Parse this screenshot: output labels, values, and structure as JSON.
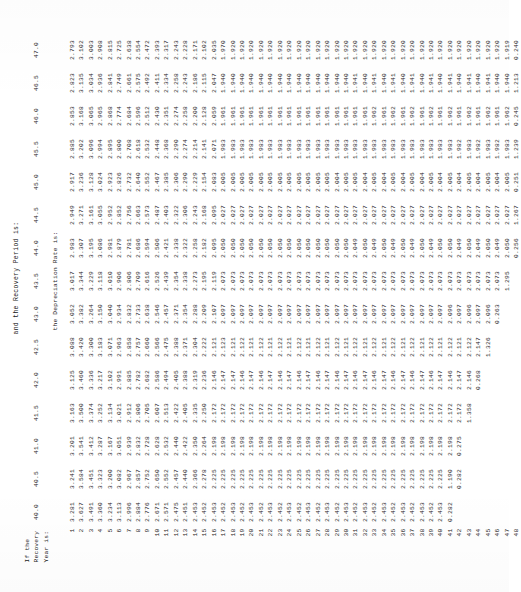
{
  "document": {
    "heading_line_1": "and the Recovery Period is:",
    "heading_line_2": "the Depreciation Rate is:",
    "stub_header": [
      "If the",
      "Recovery",
      "Year is:"
    ]
  },
  "chart_data": {
    "type": "table",
    "title": "and the Recovery Period is:",
    "subtitle": "the Depreciation Rate is:",
    "xlabel": "Recovery Period (years)",
    "ylabel": "Recovery Year",
    "categories": [
      "40.0",
      "40.5",
      "41.0",
      "41.5",
      "42.0",
      "42.5",
      "43.0",
      "43.5",
      "44.0",
      "44.5",
      "45.0",
      "45.5",
      "46.0",
      "46.5",
      "47.0"
    ],
    "row_labels": [
      "1",
      "2",
      "3",
      "4",
      "5",
      "6",
      "7",
      "8",
      "9",
      "10",
      "11",
      "12",
      "13",
      "14",
      "15",
      "16",
      "17",
      "18",
      "19",
      "20",
      "21",
      "22",
      "23",
      "24",
      "25",
      "26",
      "27",
      "28",
      "29",
      "30",
      "31",
      "32",
      "33",
      "34",
      "35",
      "36",
      "37",
      "38",
      "39",
      "40",
      "41",
      "42",
      "43",
      "44",
      "45",
      "46",
      "47",
      "48"
    ],
    "rows": [
      [
        "3.281",
        "3.241",
        "3.201",
        "3.163",
        "3.125",
        "3.088",
        "3.052",
        "3.017",
        "2.983",
        "2.949",
        "2.917",
        "2.885",
        "2.853",
        "2.823",
        "2.793"
      ],
      [
        "3.627",
        "3.584",
        "3.541",
        "3.500",
        "3.460",
        "3.420",
        "3.382",
        "3.344",
        "3.307",
        "3.271",
        "3.236",
        "3.202",
        "3.168",
        "3.135",
        "3.102"
      ],
      [
        "3.491",
        "3.451",
        "3.412",
        "3.374",
        "3.336",
        "3.300",
        "3.264",
        "3.229",
        "3.195",
        "3.161",
        "3.128",
        "3.096",
        "3.065",
        "3.034",
        "3.003"
      ],
      [
        "3.360",
        "3.323",
        "3.287",
        "3.252",
        "3.217",
        "3.183",
        "3.150",
        "3.118",
        "3.086",
        "3.055",
        "3.024",
        "2.994",
        "2.965",
        "2.936",
        "2.908"
      ],
      [
        "3.234",
        "3.200",
        "3.167",
        "3.134",
        "3.102",
        "3.071",
        "3.040",
        "3.010",
        "2.981",
        "2.952",
        "2.923",
        "2.895",
        "2.868",
        "2.841",
        "2.815"
      ],
      [
        "3.113",
        "3.082",
        "3.051",
        "3.021",
        "2.991",
        "2.963",
        "2.934",
        "2.906",
        "2.879",
        "2.852",
        "2.826",
        "2.800",
        "2.774",
        "2.749",
        "2.725"
      ],
      [
        "2.996",
        "2.967",
        "2.939",
        "2.912",
        "2.885",
        "2.858",
        "2.832",
        "2.806",
        "2.781",
        "2.756",
        "2.732",
        "2.708",
        "2.684",
        "2.661",
        "2.638"
      ],
      [
        "2.884",
        "2.857",
        "2.832",
        "2.806",
        "2.782",
        "2.757",
        "2.733",
        "2.709",
        "2.686",
        "2.663",
        "2.640",
        "2.618",
        "2.596",
        "2.575",
        "2.554"
      ],
      [
        "2.776",
        "2.752",
        "2.728",
        "2.705",
        "2.682",
        "2.660",
        "2.638",
        "2.616",
        "2.594",
        "2.573",
        "2.552",
        "2.532",
        "2.512",
        "2.492",
        "2.472"
      ],
      [
        "2.671",
        "2.650",
        "2.628",
        "2.607",
        "2.586",
        "2.566",
        "2.546",
        "2.526",
        "2.506",
        "2.487",
        "2.467",
        "2.448",
        "2.430",
        "2.411",
        "2.393"
      ],
      [
        "2.571",
        "2.552",
        "2.532",
        "2.513",
        "2.494",
        "2.475",
        "2.457",
        "2.439",
        "2.421",
        "2.403",
        "2.385",
        "2.368",
        "2.351",
        "2.334",
        "2.317"
      ],
      [
        "2.475",
        "2.457",
        "2.440",
        "2.422",
        "2.405",
        "2.388",
        "2.371",
        "2.354",
        "2.338",
        "2.322",
        "2.306",
        "2.290",
        "2.274",
        "2.258",
        "2.243"
      ],
      [
        "2.451",
        "2.440",
        "2.422",
        "2.405",
        "2.388",
        "2.371",
        "2.354",
        "2.338",
        "2.322",
        "2.306",
        "2.290",
        "2.274",
        "2.258",
        "2.243",
        "2.228"
      ],
      [
        "2.453",
        "2.366",
        "2.350",
        "2.335",
        "2.319",
        "2.304",
        "2.288",
        "2.273",
        "2.258",
        "2.243",
        "2.229",
        "2.214",
        "2.200",
        "2.186",
        "2.171"
      ],
      [
        "2.452",
        "2.278",
        "2.264",
        "2.250",
        "2.236",
        "2.222",
        "2.209",
        "2.195",
        "2.182",
        "2.168",
        "2.154",
        "2.141",
        "2.128",
        "2.115",
        "2.102"
      ],
      [
        "2.453",
        "2.225",
        "2.198",
        "2.172",
        "2.146",
        "2.121",
        "2.107",
        "2.119",
        "2.095",
        "2.095",
        "2.083",
        "2.071",
        "2.059",
        "2.047",
        "2.035"
      ],
      [
        "2.452",
        "2.225",
        "2.198",
        "2.172",
        "2.147",
        "2.123",
        "2.097",
        "2.073",
        "2.050",
        "2.027",
        "2.005",
        "1.983",
        "1.961",
        "1.940",
        "1.970"
      ],
      [
        "2.453",
        "2.225",
        "2.198",
        "2.172",
        "2.147",
        "2.121",
        "2.097",
        "2.073",
        "2.050",
        "2.027",
        "2.005",
        "1.983",
        "1.961",
        "1.940",
        "1.920"
      ],
      [
        "2.452",
        "2.225",
        "2.198",
        "2.172",
        "2.146",
        "2.122",
        "2.097",
        "2.073",
        "2.050",
        "2.027",
        "2.005",
        "1.983",
        "1.961",
        "1.940",
        "1.920"
      ],
      [
        "2.453",
        "2.225",
        "2.198",
        "2.172",
        "2.147",
        "2.121",
        "2.097",
        "2.073",
        "2.050",
        "2.027",
        "2.005",
        "1.983",
        "1.961",
        "1.940",
        "1.920"
      ],
      [
        "2.452",
        "2.225",
        "2.198",
        "2.172",
        "2.146",
        "2.122",
        "2.097",
        "2.073",
        "2.050",
        "2.027",
        "2.005",
        "1.983",
        "1.961",
        "1.940",
        "1.920"
      ],
      [
        "2.453",
        "2.225",
        "2.198",
        "2.172",
        "2.147",
        "2.121",
        "2.097",
        "2.073",
        "2.050",
        "2.027",
        "2.005",
        "1.983",
        "1.961",
        "1.940",
        "1.920"
      ],
      [
        "2.452",
        "2.225",
        "2.198",
        "2.172",
        "2.146",
        "2.122",
        "2.097",
        "2.073",
        "2.050",
        "2.027",
        "2.005",
        "1.983",
        "1.961",
        "1.940",
        "1.920"
      ],
      [
        "2.453",
        "2.225",
        "2.198",
        "2.172",
        "2.147",
        "2.121",
        "2.097",
        "2.073",
        "2.050",
        "2.027",
        "2.005",
        "1.983",
        "1.961",
        "1.940",
        "1.920"
      ],
      [
        "2.452",
        "2.225",
        "2.198",
        "2.172",
        "2.146",
        "2.122",
        "2.097",
        "2.073",
        "2.050",
        "2.027",
        "2.005",
        "1.983",
        "1.961",
        "1.940",
        "1.920"
      ],
      [
        "2.453",
        "2.225",
        "2.198",
        "2.172",
        "2.147",
        "2.121",
        "2.097",
        "2.073",
        "2.050",
        "2.027",
        "2.005",
        "1.983",
        "1.961",
        "1.940",
        "1.920"
      ],
      [
        "2.452",
        "2.225",
        "2.198",
        "2.172",
        "2.146",
        "2.122",
        "2.097",
        "2.073",
        "2.050",
        "2.027",
        "2.005",
        "1.983",
        "1.961",
        "1.940",
        "1.920"
      ],
      [
        "2.453",
        "2.225",
        "2.198",
        "2.172",
        "2.147",
        "2.121",
        "2.097",
        "2.073",
        "2.050",
        "2.027",
        "2.005",
        "1.983",
        "1.961",
        "1.940",
        "1.920"
      ],
      [
        "2.452",
        "2.225",
        "2.198",
        "2.172",
        "2.146",
        "2.122",
        "2.097",
        "2.073",
        "2.050",
        "2.027",
        "2.004",
        "1.983",
        "1.961",
        "1.940",
        "1.920"
      ],
      [
        "2.453",
        "2.225",
        "2.198",
        "2.172",
        "2.147",
        "2.121",
        "2.097",
        "2.073",
        "2.050",
        "2.027",
        "2.005",
        "1.983",
        "1.961",
        "1.940",
        "1.920"
      ],
      [
        "2.452",
        "2.225",
        "2.198",
        "2.172",
        "2.146",
        "2.122",
        "2.097",
        "2.073",
        "2.049",
        "2.027",
        "2.005",
        "1.983",
        "1.961",
        "1.941",
        "1.920"
      ],
      [
        "2.453",
        "2.225",
        "2.198",
        "2.172",
        "2.147",
        "2.121",
        "2.097",
        "2.073",
        "2.050",
        "2.027",
        "2.004",
        "1.983",
        "1.961",
        "1.940",
        "1.920"
      ],
      [
        "2.452",
        "2.225",
        "2.198",
        "2.172",
        "2.146",
        "2.122",
        "2.097",
        "2.073",
        "2.049",
        "2.027",
        "2.005",
        "1.983",
        "1.962",
        "1.941",
        "1.920"
      ],
      [
        "2.453",
        "2.225",
        "2.198",
        "2.172",
        "2.147",
        "2.121",
        "2.097",
        "2.073",
        "2.050",
        "2.027",
        "2.004",
        "1.983",
        "1.961",
        "1.940",
        "1.920"
      ],
      [
        "2.452",
        "2.225",
        "2.198",
        "2.172",
        "2.146",
        "2.122",
        "2.097",
        "2.073",
        "2.049",
        "2.027",
        "2.005",
        "1.983",
        "1.962",
        "1.941",
        "1.920"
      ],
      [
        "2.453",
        "2.225",
        "2.198",
        "2.172",
        "2.147",
        "2.121",
        "2.097",
        "2.073",
        "2.050",
        "2.027",
        "2.004",
        "1.983",
        "1.961",
        "1.940",
        "1.920"
      ],
      [
        "2.452",
        "2.225",
        "2.198",
        "2.172",
        "2.146",
        "2.122",
        "2.097",
        "2.073",
        "2.049",
        "2.027",
        "2.005",
        "1.983",
        "1.962",
        "1.941",
        "1.920"
      ],
      [
        "2.453",
        "2.225",
        "2.198",
        "2.172",
        "2.147",
        "2.121",
        "2.097",
        "2.073",
        "2.050",
        "2.027",
        "2.004",
        "1.983",
        "1.961",
        "1.940",
        "1.920"
      ],
      [
        "2.452",
        "2.225",
        "2.198",
        "2.172",
        "2.146",
        "2.122",
        "2.097",
        "2.073",
        "2.049",
        "2.027",
        "2.005",
        "1.983",
        "1.962",
        "1.941",
        "1.920"
      ],
      [
        "2.453",
        "2.225",
        "2.198",
        "2.172",
        "2.147",
        "2.121",
        "2.097",
        "2.073",
        "2.050",
        "2.027",
        "2.004",
        "1.983",
        "1.961",
        "1.940",
        "1.920"
      ],
      [
        "0.282",
        "1.190",
        "2.198",
        "2.172",
        "2.146",
        "2.122",
        "2.096",
        "2.073",
        "2.050",
        "2.027",
        "2.005",
        "1.983",
        "1.962",
        "1.941",
        "1.920"
      ],
      [
        "",
        "0.282",
        "0.275",
        "2.172",
        "2.147",
        "2.121",
        "2.097",
        "2.073",
        "2.049",
        "2.027",
        "2.004",
        "1.982",
        "1.961",
        "1.940",
        "1.920"
      ],
      [
        "",
        "",
        "",
        "1.358",
        "2.146",
        "2.122",
        "2.096",
        "2.073",
        "2.050",
        "2.027",
        "2.005",
        "1.983",
        "1.962",
        "1.941",
        "1.920"
      ],
      [
        "",
        "",
        "",
        "",
        "0.268",
        "2.147",
        "2.097",
        "2.073",
        "2.049",
        "2.027",
        "2.004",
        "1.982",
        "1.961",
        "1.940",
        "1.920"
      ],
      [
        "",
        "",
        "",
        "",
        "",
        "1.326",
        "2.096",
        "2.073",
        "2.050",
        "2.027",
        "2.005",
        "1.983",
        "1.962",
        "1.941",
        "1.920"
      ],
      [
        "",
        "",
        "",
        "",
        "",
        "",
        "0.263",
        "2.073",
        "2.049",
        "2.027",
        "2.004",
        "1.982",
        "1.961",
        "1.940",
        "1.920"
      ],
      [
        "",
        "",
        "",
        "",
        "",
        "",
        "",
        "1.295",
        "2.050",
        "2.027",
        "2.005",
        "1.983",
        "1.962",
        "1.940",
        "1.919"
      ],
      [
        "",
        "",
        "",
        "",
        "",
        "",
        "",
        "",
        "0.256",
        "1.267",
        "0.251",
        "1.239",
        "0.245",
        "1.213",
        "0.240"
      ]
    ]
  }
}
